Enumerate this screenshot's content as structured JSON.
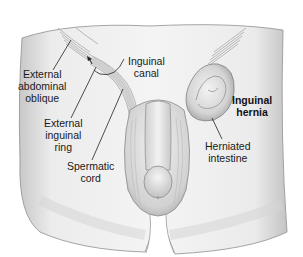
{
  "figure": {
    "colors": {
      "skin_light": "#f2f2f2",
      "skin_mid": "#d9d9d9",
      "skin_shadow": "#a8a8a8",
      "outline": "#8a8a8a",
      "label_text": "#1a1a1a",
      "leader_line": "#222222"
    },
    "labels": {
      "external_abdominal_oblique": [
        "External",
        "abdominal",
        "oblique"
      ],
      "inguinal_canal": [
        "Inguinal",
        "canal"
      ],
      "external_inguinal_ring": [
        "External",
        "inguinal",
        "ring"
      ],
      "spermatic_cord": [
        "Spermatic",
        "cord"
      ],
      "inguinal_hernia": [
        "Inguinal",
        "hernia"
      ],
      "herniated_intestine": [
        "Herniated",
        "intestine"
      ]
    }
  }
}
